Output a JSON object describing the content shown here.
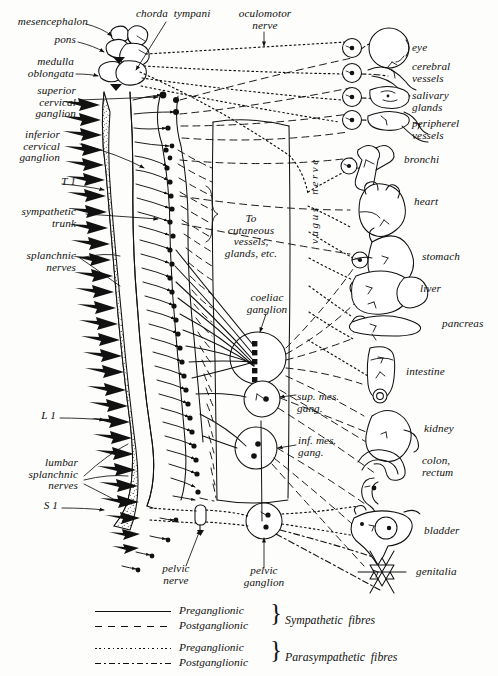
{
  "figure": {
    "ink_color": "#111111",
    "background_color": "#fdfdfb"
  },
  "left_labels": [
    {
      "name": "mesencephalon",
      "text": "mesencephalon"
    },
    {
      "name": "pons",
      "text": "pons"
    },
    {
      "name": "medulla-oblongata",
      "text": "medulla\noblongata"
    },
    {
      "name": "superior-cervical-ganglion",
      "text": "superior\ncervical\nganglion"
    },
    {
      "name": "inferior-cervical-ganglion",
      "text": "inferior\ncervical\nganglion"
    },
    {
      "name": "t1",
      "text": "T 1"
    },
    {
      "name": "sympathetic-trunk",
      "text": "sympathetic\ntrunk"
    },
    {
      "name": "splanchnic-nerves",
      "text": "splanchnic\nnerves"
    },
    {
      "name": "l1",
      "text": "L 1"
    },
    {
      "name": "lumbar-splanchnic-nerves",
      "text": "lumbar\nsplanchnic\nnerves"
    },
    {
      "name": "s1",
      "text": "S 1"
    }
  ],
  "top_labels": [
    {
      "name": "chorda-tympani",
      "text": "chorda  tympani"
    },
    {
      "name": "oculomotor-nerve",
      "text": "oculomotor\nnerve"
    }
  ],
  "center_labels": [
    {
      "name": "to-cutaneous-vessels",
      "text": "To\ncutaneous\nvessels,\nglands, etc."
    },
    {
      "name": "coeliac-ganglion",
      "text": "coeliac\nganglion"
    },
    {
      "name": "superior-mesenteric-ganglion",
      "text": "sup. mes.\ngang."
    },
    {
      "name": "inferior-mesenteric-ganglion",
      "text": "inf. mes.\ngang."
    },
    {
      "name": "pelvic-ganglion",
      "text": "pelvic\nganglion"
    },
    {
      "name": "pelvic-nerve",
      "text": "pelvic\nnerve"
    },
    {
      "name": "vagus-nerve",
      "text": "vagus  nerve"
    }
  ],
  "organs": [
    {
      "name": "eye",
      "text": "eye"
    },
    {
      "name": "cerebral-vessels",
      "text": "cerebral\nvessels"
    },
    {
      "name": "salivary-glands",
      "text": "salivary\nglands"
    },
    {
      "name": "peripheral-vessels",
      "text": "peripherel\nvessels"
    },
    {
      "name": "bronchi",
      "text": "bronchi"
    },
    {
      "name": "heart",
      "text": "heart"
    },
    {
      "name": "stomach",
      "text": "stomach"
    },
    {
      "name": "liver",
      "text": "liver"
    },
    {
      "name": "pancreas",
      "text": "pancreas"
    },
    {
      "name": "intestine",
      "text": "intestine"
    },
    {
      "name": "kidney",
      "text": "kidney"
    },
    {
      "name": "colon-rectum",
      "text": "colon,\nrectum"
    },
    {
      "name": "bladder",
      "text": "bladder"
    },
    {
      "name": "genitalia",
      "text": "genitalia"
    }
  ],
  "legend": {
    "rows": [
      {
        "style": "solid",
        "label": "Preganglionic"
      },
      {
        "style": "dash",
        "label": "Postganglionic"
      },
      {
        "style": "dot",
        "label": "Preganglionic"
      },
      {
        "style": "dashdot",
        "label": "Postganglionic"
      }
    ],
    "groups": [
      {
        "name": "sympathetic-fibres",
        "text": "Sympathetic  fibres"
      },
      {
        "name": "parasympathetic-fibres",
        "text": "Parasympathetic  fibres"
      }
    ]
  }
}
